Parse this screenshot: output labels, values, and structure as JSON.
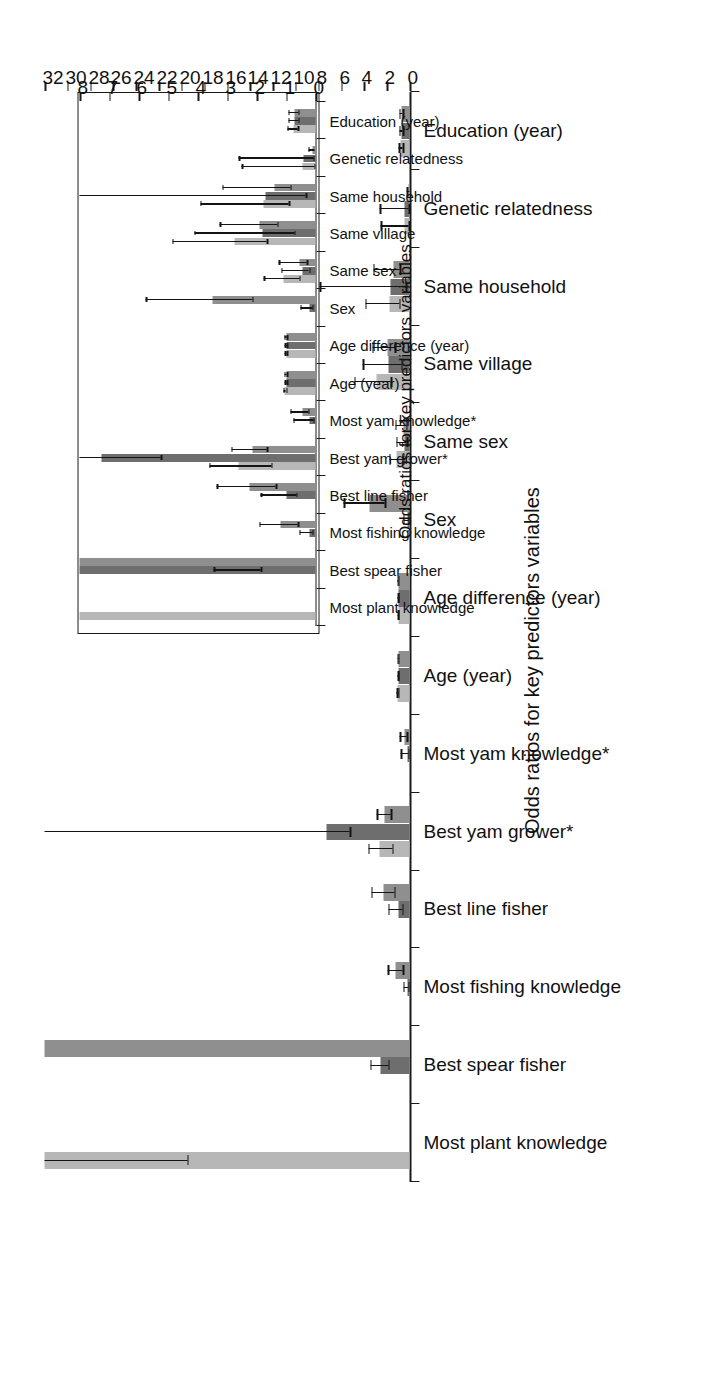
{
  "figure": {
    "orientation": "rotated-90",
    "background": "#ffffff",
    "series_colors": [
      "#b7b7b7",
      "#6e6e6e",
      "#8f8f8f"
    ]
  },
  "chart_data": [
    {
      "id": "main",
      "type": "bar",
      "title": "",
      "xlabel": "Odds ratios for key predictors variables",
      "ylabel": "",
      "grid": false,
      "legend": "none",
      "axis_value_range": [
        0,
        32
      ],
      "axis_ticks": [
        0,
        2,
        4,
        6,
        8,
        10,
        12,
        14,
        16,
        18,
        20,
        22,
        24,
        26,
        28,
        30,
        32
      ],
      "axis_tick_labels": [
        "0",
        "2",
        "4",
        "6",
        "8",
        "10",
        "12",
        "14",
        "16",
        "18",
        "20",
        "22",
        "24",
        "26",
        "28",
        "30",
        "32"
      ],
      "categories": [
        "Most plant knowledge",
        "Best spear fisher",
        "Most fishing knowledge",
        "Best line fisher",
        "Best yam grower*",
        "Most yam knowledge*",
        "Age (year)",
        "Age difference (year)",
        "Sex",
        "Same sex",
        "Same village",
        "Same household",
        "Genetic relatedness",
        "Education (year)"
      ],
      "series": [
        {
          "name": "series-1",
          "color": "#b7b7b7",
          "values": [
            32.0,
            null,
            null,
            null,
            2.6,
            null,
            1.05,
            1.0,
            null,
            1.1,
            2.9,
            1.75,
            0.45,
            0.75
          ],
          "ci_low": [
            19.5,
            null,
            null,
            null,
            1.5,
            null,
            1.0,
            0.97,
            null,
            0.55,
            1.65,
            0.9,
            0.05,
            0.6
          ],
          "ci_high": [
            32.0,
            null,
            null,
            null,
            3.6,
            null,
            1.1,
            1.04,
            null,
            1.75,
            4.85,
            3.9,
            2.5,
            0.95
          ]
        },
        {
          "name": "series-2",
          "color": "#6e6e6e",
          "values": [
            null,
            2.55,
            0.2,
            1.0,
            7.25,
            0.2,
            1.0,
            1.0,
            0.2,
            0.45,
            1.8,
            1.7,
            0.4,
            0.72
          ],
          "ci_low": [
            null,
            1.85,
            0.1,
            0.65,
            5.25,
            0.08,
            0.97,
            0.97,
            0.1,
            0.22,
            0.72,
            0.33,
            0.07,
            0.58
          ],
          "ci_high": [
            null,
            3.45,
            0.55,
            1.85,
            32.0,
            0.75,
            1.04,
            1.04,
            0.52,
            1.15,
            4.1,
            7.85,
            2.6,
            0.92
          ]
        },
        {
          "name": "series-3",
          "color": "#8f8f8f",
          "values": [
            null,
            32.0,
            1.2,
            2.25,
            2.15,
            0.45,
            1.0,
            1.0,
            3.5,
            0.55,
            1.9,
            1.4,
            0.1,
            0.72
          ],
          "ci_low": [
            null,
            32.0,
            0.6,
            1.35,
            1.65,
            0.25,
            0.97,
            0.97,
            2.15,
            0.3,
            1.3,
            0.85,
            0.02,
            0.58
          ],
          "ci_high": [
            null,
            32.0,
            1.9,
            3.35,
            2.85,
            0.85,
            1.05,
            1.05,
            5.75,
            1.25,
            3.25,
            3.15,
            0.25,
            0.92
          ]
        }
      ]
    },
    {
      "id": "inset",
      "type": "bar",
      "title": "",
      "xlabel": "Odds ratios for key predictors variables",
      "ylabel": "",
      "grid": false,
      "legend": "none",
      "axis_value_range": [
        0,
        8
      ],
      "axis_ticks": [
        0,
        1,
        2,
        3,
        4,
        5,
        6,
        7,
        8
      ],
      "axis_tick_labels": [
        "0",
        "1",
        "2",
        "3",
        "4",
        "5",
        "6",
        "7",
        "8"
      ],
      "categories": [
        "Most plant knowledge",
        "Best spear fisher",
        "Most fishing knowledge",
        "Best line fisher",
        "Best yam grower*",
        "Most yam knowledge*",
        "Age (year)",
        "Age difference (year)",
        "Sex",
        "Same sex",
        "Same village",
        "Same household",
        "Genetic relatedness",
        "Education (year)"
      ],
      "series": [
        {
          "name": "series-1",
          "color": "#b7b7b7",
          "values": [
            8.0,
            null,
            null,
            null,
            2.6,
            null,
            1.05,
            1.0,
            null,
            1.1,
            2.75,
            1.75,
            0.45,
            0.75
          ],
          "ci_low": [
            8.0,
            null,
            null,
            null,
            1.5,
            null,
            1.0,
            0.97,
            null,
            0.55,
            1.65,
            0.9,
            0.05,
            0.6
          ],
          "ci_high": [
            8.0,
            null,
            null,
            null,
            3.6,
            null,
            1.1,
            1.04,
            null,
            1.75,
            4.85,
            3.9,
            2.5,
            0.95
          ]
        },
        {
          "name": "series-2",
          "color": "#6e6e6e",
          "values": [
            null,
            8.0,
            0.2,
            1.0,
            7.25,
            0.2,
            1.0,
            1.0,
            0.2,
            0.45,
            1.8,
            1.7,
            0.4,
            0.72
          ],
          "ci_low": [
            null,
            1.85,
            0.1,
            0.65,
            5.25,
            0.08,
            0.97,
            0.97,
            0.1,
            0.22,
            0.72,
            0.33,
            0.07,
            0.58
          ],
          "ci_high": [
            null,
            3.45,
            0.55,
            1.85,
            8.0,
            0.75,
            1.04,
            1.04,
            0.52,
            1.15,
            4.1,
            8.0,
            2.6,
            0.92
          ]
        },
        {
          "name": "series-3",
          "color": "#8f8f8f",
          "values": [
            null,
            8.0,
            1.2,
            2.25,
            2.15,
            0.45,
            1.0,
            1.0,
            3.5,
            0.55,
            1.9,
            1.4,
            0.1,
            0.72
          ],
          "ci_low": [
            null,
            8.0,
            0.6,
            1.35,
            1.65,
            0.25,
            0.97,
            0.97,
            2.15,
            0.3,
            1.3,
            0.85,
            0.02,
            0.58
          ],
          "ci_high": [
            null,
            8.0,
            1.9,
            3.35,
            2.85,
            0.85,
            1.05,
            1.05,
            5.75,
            1.25,
            3.25,
            3.15,
            0.25,
            0.92
          ]
        }
      ]
    }
  ]
}
